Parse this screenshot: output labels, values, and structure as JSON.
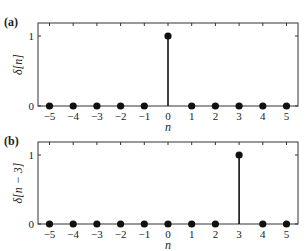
{
  "chart_data": [
    {
      "type": "stem",
      "panel_label": "(a)",
      "xlabel": "n",
      "ylabel": "δ[n]",
      "x": [
        -5,
        -4,
        -3,
        -2,
        -1,
        0,
        1,
        2,
        3,
        4,
        5
      ],
      "values": [
        0,
        0,
        0,
        0,
        0,
        1,
        0,
        0,
        0,
        0,
        0
      ],
      "xticks": [
        "−5",
        "−4",
        "−3",
        "−2",
        "−1",
        "0",
        "1",
        "2",
        "3",
        "4",
        "5"
      ],
      "yticks": [
        "0",
        "1"
      ],
      "xlim": [
        -5.5,
        5.5
      ],
      "ylim": [
        0,
        1.2
      ],
      "grid": false
    },
    {
      "type": "stem",
      "panel_label": "(b)",
      "xlabel": "n",
      "ylabel": "δ[n − 3]",
      "x": [
        -5,
        -4,
        -3,
        -2,
        -1,
        0,
        1,
        2,
        3,
        4,
        5
      ],
      "values": [
        0,
        0,
        0,
        0,
        0,
        0,
        0,
        0,
        1,
        0,
        0
      ],
      "xticks": [
        "−5",
        "−4",
        "−3",
        "−2",
        "−1",
        "0",
        "1",
        "2",
        "3",
        "4",
        "5"
      ],
      "yticks": [
        "0",
        "1"
      ],
      "xlim": [
        -5.5,
        5.5
      ],
      "ylim": [
        0,
        1.2
      ],
      "grid": false
    }
  ],
  "style": {
    "stem_color": "#111111",
    "axis_color": "#333333"
  }
}
